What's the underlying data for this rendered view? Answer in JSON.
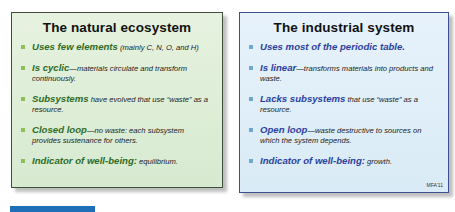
{
  "panels": {
    "natural": {
      "title": "The natural ecosystem",
      "items": [
        {
          "key": "Uses few elements",
          "rest": " (mainly C, N, O, and H)"
        },
        {
          "key": "Is cyclic",
          "rest": "—materials circulate and transform continuously."
        },
        {
          "key": "Subsystems",
          "rest": " have evolved that use “waste” as a resource."
        },
        {
          "key": "Closed loop",
          "rest": "—no waste: each subsystem provides sustenance for others."
        },
        {
          "key": "Indicator of well-being:",
          "rest": " equilibrium."
        }
      ],
      "colors": {
        "background": "#dcecd4",
        "accent": "#2f6b25",
        "bullet": "#8cbf5a"
      }
    },
    "industrial": {
      "title": "The industrial system",
      "items": [
        {
          "key": "Uses most of the periodic table.",
          "rest": ""
        },
        {
          "key": "Is linear",
          "rest": "—transforms materials into products and waste."
        },
        {
          "key": "Lacks subsystems",
          "rest": " that use “waste” as a resource."
        },
        {
          "key": "Open loop",
          "rest": "—waste destructive to sources on which the system depends."
        },
        {
          "key": "Indicator of well-being:",
          "rest": " growth."
        }
      ],
      "footer_tag": "MFA'11",
      "colors": {
        "background": "#deedf7",
        "accent": "#2b3fa0",
        "bullet": "#6fa7cf"
      }
    }
  },
  "bottom_bar": {
    "color": "#1f6fb8"
  }
}
